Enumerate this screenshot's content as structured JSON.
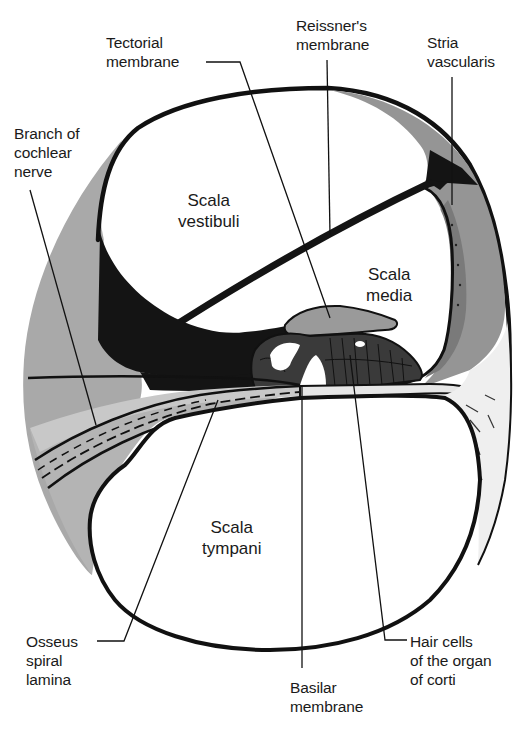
{
  "figure": {
    "colors": {
      "background": "#ffffff",
      "outline": "#111111",
      "bone_gray": "#a9a9a9",
      "light_gray": "#cfcfcf",
      "stria_gray": "#8f8f8f",
      "dark_fill": "#141414",
      "ligament_fill": "#ececec"
    }
  },
  "regions": {
    "scala_vestibuli": [
      "Scala",
      "vestibuli"
    ],
    "scala_media": [
      "Scala",
      "media"
    ],
    "scala_tympani": [
      "Scala",
      "tympani"
    ]
  },
  "labels": {
    "tectorial_membrane": [
      "Tectorial",
      "membrane"
    ],
    "reissners_membrane": [
      "Reissner's",
      "membrane"
    ],
    "stria_vascularis": [
      "Stria",
      "vascularis"
    ],
    "branch_of_cochlear_nerve": [
      "Branch of",
      "cochlear",
      "nerve"
    ],
    "osseus_spiral_lamina": [
      "Osseus",
      "spiral",
      "lamina"
    ],
    "basilar_membrane": [
      "Basilar",
      "membrane"
    ],
    "hair_cells": [
      "Hair cells",
      "of the organ",
      "of corti"
    ]
  }
}
